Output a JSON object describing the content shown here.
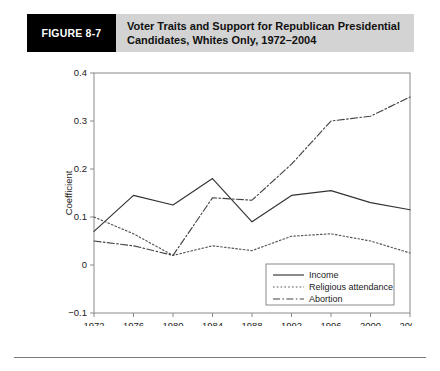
{
  "figure": {
    "tag": "FIGURE 8-7",
    "title": "Voter Traits and Support for Republican Presidential Candidates, Whites Only, 1972–2004"
  },
  "chart_data": {
    "type": "line",
    "title": "",
    "xlabel": "Year",
    "ylabel": "Coefficient",
    "categories": [
      "1972",
      "1976",
      "1980",
      "1984",
      "1988",
      "1992",
      "1996",
      "2000",
      "2004"
    ],
    "x": [
      1972,
      1976,
      1980,
      1984,
      1988,
      1992,
      1996,
      2000,
      2004
    ],
    "xlim": [
      1972,
      2004
    ],
    "ylim": [
      -0.1,
      0.4
    ],
    "yticks": [
      "0.4",
      "0.3",
      "0.2",
      "0.1",
      "0",
      "−0.1"
    ],
    "ytick_values": [
      0.4,
      0.3,
      0.2,
      0.1,
      0,
      -0.1
    ],
    "grid": false,
    "legend_position": "bottom-right",
    "series": [
      {
        "name": "Income",
        "style": "solid",
        "color": "#333333",
        "values": [
          0.07,
          0.145,
          0.125,
          0.18,
          0.09,
          0.145,
          0.155,
          0.13,
          0.115
        ]
      },
      {
        "name": "Religious attendance",
        "style": "dotted",
        "color": "#555555",
        "values": [
          0.1,
          0.065,
          0.02,
          0.04,
          0.03,
          0.06,
          0.065,
          0.05,
          0.025
        ]
      },
      {
        "name": "Abortion",
        "style": "dashdot",
        "color": "#444444",
        "values": [
          0.05,
          0.04,
          0.02,
          0.14,
          0.135,
          0.21,
          0.3,
          0.31,
          0.35
        ]
      }
    ]
  }
}
